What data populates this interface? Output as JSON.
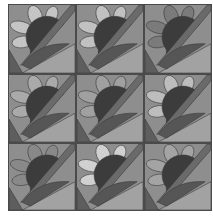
{
  "grid": {
    "rows": 3,
    "cols": 3
  },
  "colors": {
    "background": "#8e8e8e",
    "center": "#3c3c3c",
    "stem": "#6a6a6a",
    "leaf": "#565656",
    "ground": "#a2a2a2",
    "corner": "#5e5e5e",
    "outline": "#3a3a3a"
  },
  "blocks": [
    {
      "id": 1,
      "petal": "#c8c8c8",
      "petal_alt": "#d2d2d2"
    },
    {
      "id": 2,
      "petal": "#c4c4c4",
      "petal_alt": "#cecece"
    },
    {
      "id": 3,
      "petal": "#7c7c7c",
      "petal_alt": "#868686"
    },
    {
      "id": 4,
      "petal": "#acacac",
      "petal_alt": "#b6b6b6"
    },
    {
      "id": 5,
      "petal": "#a2a2a2",
      "petal_alt": "#aaaaaa"
    },
    {
      "id": 6,
      "petal": "#c0c0c0",
      "petal_alt": "#cacaca"
    },
    {
      "id": 7,
      "petal": "#8a8a8a",
      "petal_alt": "#949494"
    },
    {
      "id": 8,
      "petal": "#d4d4d4",
      "petal_alt": "#dcdcdc"
    },
    {
      "id": 9,
      "petal": "#a6a6a6",
      "petal_alt": "#b0b0b0"
    }
  ]
}
